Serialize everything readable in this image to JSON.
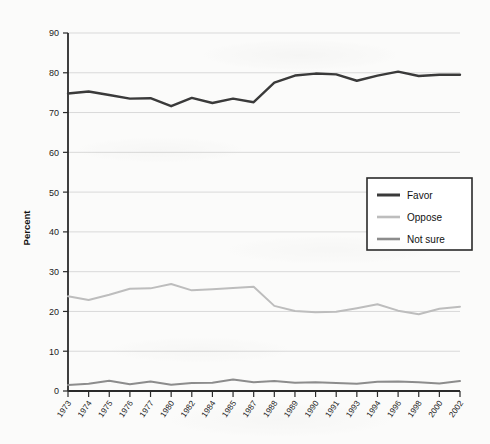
{
  "chart_data": {
    "type": "line",
    "title": "",
    "xlabel": "",
    "ylabel": "Percent",
    "ylim": [
      0,
      90
    ],
    "ytick_step": 10,
    "grid": true,
    "legend_position": "middle-right",
    "categories": [
      "1973",
      "1974",
      "1975",
      "1976",
      "1977",
      "1980",
      "1982",
      "1984",
      "1985",
      "1987",
      "1988",
      "1989",
      "1990",
      "1991",
      "1993",
      "1994",
      "1996",
      "1998",
      "2000",
      "2002"
    ],
    "yticks": [
      "0",
      "10",
      "20",
      "30",
      "40",
      "50",
      "60",
      "70",
      "80",
      "90"
    ],
    "series": [
      {
        "name": "Favor",
        "color": "#3a3a3a",
        "values": [
          74.8,
          75.3,
          74.4,
          73.5,
          73.6,
          71.6,
          73.7,
          72.4,
          73.5,
          72.6,
          77.5,
          79.3,
          79.8,
          79.6,
          78.0,
          79.3,
          80.3,
          79.2,
          79.5,
          79.5
        ]
      },
      {
        "name": "Oppose",
        "color": "#bdbdbd",
        "values": [
          23.8,
          22.9,
          24.2,
          25.7,
          25.8,
          26.9,
          25.3,
          25.6,
          25.9,
          26.2,
          21.4,
          20.1,
          19.8,
          19.9,
          20.8,
          21.8,
          20.2,
          19.3,
          20.7,
          21.2
        ]
      },
      {
        "name": "Not sure",
        "color": "#8c8c8c",
        "values": [
          1.5,
          1.8,
          2.6,
          1.7,
          2.4,
          1.6,
          2.0,
          2.1,
          2.9,
          2.2,
          2.5,
          2.1,
          2.2,
          2.0,
          1.8,
          2.3,
          2.4,
          2.2,
          1.9,
          2.5
        ]
      }
    ]
  },
  "legend": {
    "items": [
      {
        "label": "Favor",
        "color": "#3a3a3a"
      },
      {
        "label": "Oppose",
        "color": "#bdbdbd"
      },
      {
        "label": "Not sure",
        "color": "#8c8c8c"
      }
    ]
  },
  "colors": {
    "background": "#fbfbfa",
    "grid": "#d9d9d9",
    "axis": "#2a2a2a",
    "text": "#1c1c1c"
  }
}
